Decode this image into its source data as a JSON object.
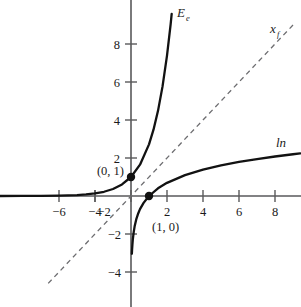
{
  "chart_data": {
    "type": "line",
    "title": "",
    "subtitle": "",
    "xlabel": "",
    "ylabel": "",
    "xlim": [
      -7.3,
      9.4
    ],
    "ylim": [
      -5.3,
      9.6
    ],
    "grid": false,
    "legend_position": "inline-curve-labels",
    "x_ticks": [
      -6,
      -4,
      -2,
      2,
      4,
      6,
      8
    ],
    "y_ticks": [
      -4,
      -2,
      2,
      4,
      6,
      8
    ],
    "x_tick_labels": [
      "−6",
      "−4",
      "−2",
      "2",
      "4",
      "6",
      "8"
    ],
    "y_tick_labels": [
      "−4",
      "−2",
      "2",
      "4",
      "6",
      "8"
    ],
    "series": [
      {
        "name": "E_e",
        "label_text": "E",
        "label_sub": "e",
        "style": "solid",
        "color": "#121212",
        "description": "exponential function y = e^x",
        "points": [
          [
            -7.3,
            0.0007
          ],
          [
            -6.0,
            0.0025
          ],
          [
            -5.0,
            0.0067
          ],
          [
            -4.0,
            0.0183
          ],
          [
            -3.0,
            0.0498
          ],
          [
            -2.5,
            0.0821
          ],
          [
            -2.0,
            0.1353
          ],
          [
            -1.5,
            0.2231
          ],
          [
            -1.0,
            0.3679
          ],
          [
            -0.5,
            0.6065
          ],
          [
            0.0,
            1.0
          ],
          [
            0.5,
            1.6487
          ],
          [
            1.0,
            2.7183
          ],
          [
            1.25,
            3.4903
          ],
          [
            1.5,
            4.4817
          ],
          [
            1.75,
            5.7546
          ],
          [
            2.0,
            7.3891
          ],
          [
            2.2,
            9.025
          ],
          [
            2.26,
            9.5831
          ]
        ]
      },
      {
        "name": "ln",
        "label_text": "ln",
        "label_sub": "",
        "style": "solid",
        "color": "#121212",
        "description": "natural logarithm y = ln(x)",
        "points": [
          [
            0.048,
            -3.04
          ],
          [
            0.06,
            -2.81
          ],
          [
            0.08,
            -2.53
          ],
          [
            0.1,
            -2.3
          ],
          [
            0.15,
            -1.9
          ],
          [
            0.2,
            -1.61
          ],
          [
            0.3,
            -1.2
          ],
          [
            0.4,
            -0.92
          ],
          [
            0.5,
            -0.69
          ],
          [
            0.7,
            -0.36
          ],
          [
            1.0,
            0.0
          ],
          [
            1.5,
            0.405
          ],
          [
            2.0,
            0.693
          ],
          [
            3.0,
            1.099
          ],
          [
            4.0,
            1.386
          ],
          [
            5.0,
            1.609
          ],
          [
            6.0,
            1.792
          ],
          [
            7.0,
            1.946
          ],
          [
            8.0,
            2.079
          ],
          [
            9.0,
            2.197
          ],
          [
            9.4,
            2.241
          ]
        ]
      },
      {
        "name": "x_f",
        "label_text": "x",
        "label_sub": "f",
        "style": "dashed",
        "color": "#6d6d70",
        "description": "identity line y = x (axis of symmetry)",
        "points": [
          [
            -4.6,
            -4.6
          ],
          [
            9.0,
            9.0
          ]
        ]
      }
    ],
    "annotations": [
      {
        "text": "(0, 1)",
        "x": 0,
        "y": 1,
        "marker": "filled-dot",
        "label_offset": "left"
      },
      {
        "text": "(1, 0)",
        "x": 1,
        "y": 0,
        "marker": "filled-dot",
        "label_offset": "below"
      }
    ]
  },
  "labels": {
    "exp_label_main": "E",
    "exp_label_sub": "e",
    "ln_label": "ln",
    "identity_label_main": "x",
    "identity_label_sub": "f",
    "point_0_1": "(0, 1)",
    "point_1_0": "(1, 0)"
  },
  "ticks": {
    "x_neg_6": "−6",
    "x_neg_4": "−4",
    "x_neg_2": "−2",
    "x_2": "2",
    "x_4": "4",
    "x_6": "6",
    "x_8": "8",
    "y_8": "8",
    "y_6": "6",
    "y_4": "4",
    "y_2": "2",
    "y_neg_2": "−2",
    "y_neg_4": "−4"
  },
  "colors": {
    "background": "#ffffff",
    "curve": "#121212",
    "axis": "#59595b",
    "dashed": "#6d6d70",
    "text": "#1a1a1a"
  }
}
